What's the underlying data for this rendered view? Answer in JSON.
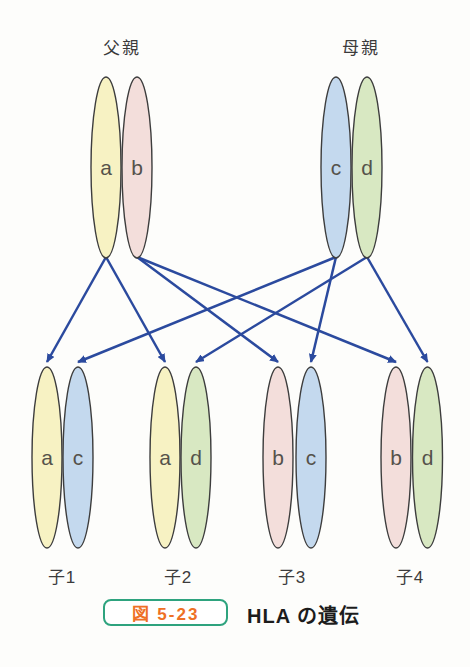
{
  "diagram": {
    "father": {
      "label": "父親",
      "haplotypes": [
        "a",
        "b"
      ]
    },
    "mother": {
      "label": "母親",
      "haplotypes": [
        "c",
        "d"
      ]
    },
    "children": [
      {
        "label": "子1",
        "haplotypes": [
          "a",
          "c"
        ]
      },
      {
        "label": "子2",
        "haplotypes": [
          "a",
          "d"
        ]
      },
      {
        "label": "子3",
        "haplotypes": [
          "b",
          "c"
        ]
      },
      {
        "label": "子4",
        "haplotypes": [
          "b",
          "d"
        ]
      }
    ],
    "haplotype_colors": {
      "a": "#f7f2c3",
      "b": "#f3dedb",
      "c": "#c4d9ee",
      "d": "#d8e8c2"
    },
    "ellipse_outline_color": "#3d3d3d",
    "letter_color": "#55524b",
    "arrow_color": "#2b4a9e"
  },
  "caption": {
    "figure_label": "図 5-23",
    "title": "HLA の遺伝",
    "box_border_color": "#2ea37e",
    "figure_label_color": "#ee7025"
  }
}
